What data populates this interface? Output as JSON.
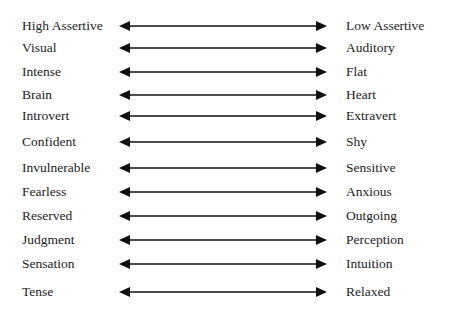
{
  "diagram": {
    "type": "bipolar-trait-scales",
    "rows": [
      {
        "left": "High Assertive",
        "right": "Low Assertive"
      },
      {
        "left": "Visual",
        "right": "Auditory"
      },
      {
        "left": "Intense",
        "right": "Flat"
      },
      {
        "left": "Brain",
        "right": "Heart"
      },
      {
        "left": "Introvert",
        "right": "Extravert"
      },
      {
        "left": "Confident",
        "right": "Shy"
      },
      {
        "left": "Invulnerable",
        "right": "Sensitive"
      },
      {
        "left": "Fearless",
        "right": "Anxious"
      },
      {
        "left": "Reserved",
        "right": "Outgoing"
      },
      {
        "left": "Judgment",
        "right": "Perception"
      },
      {
        "left": "Sensation",
        "right": "Intuition"
      },
      {
        "left": "Tense",
        "right": "Relaxed"
      }
    ],
    "connector": "double-headed-arrow",
    "colors": {
      "text": "#222222",
      "arrow": "#111111",
      "background": "#ffffff"
    }
  }
}
